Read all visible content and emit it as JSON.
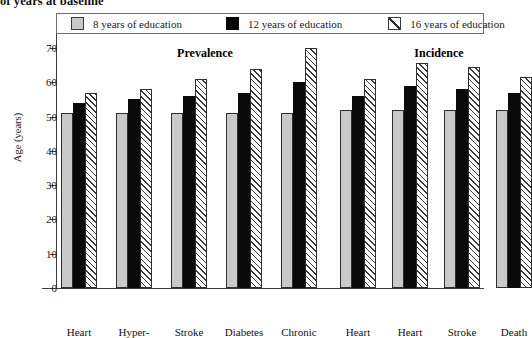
{
  "caption": "of years at baseline",
  "legend": {
    "items": [
      {
        "label": "8 years of education",
        "swatch": "gray-square-icon",
        "color": "#c9c9c9"
      },
      {
        "label": "12 years of education",
        "swatch": "black-square-icon",
        "color": "#0a0a0a"
      },
      {
        "label": "16 years of education",
        "swatch": "hatched-square-icon",
        "color": "#ffffff"
      }
    ]
  },
  "axis": {
    "ylabel": "Age (years)",
    "yticks": [
      "0",
      "10",
      "20",
      "30",
      "40",
      "50",
      "60",
      "70"
    ]
  },
  "sections": [
    {
      "title": "Prevalence"
    },
    {
      "title": "Incidence"
    }
  ],
  "chart_data": {
    "type": "bar",
    "title": "",
    "xlabel": "",
    "ylabel": "Age (years)",
    "ylim": [
      0,
      70
    ],
    "yticks": [
      0,
      10,
      20,
      30,
      40,
      50,
      60,
      70
    ],
    "grid": false,
    "legend_position": "top",
    "panels": [
      {
        "name": "Prevalence",
        "categories": [
          "Heart",
          "Hyper-",
          "Stroke",
          "Diabetes",
          "Chronic"
        ],
        "series": [
          {
            "name": "8 years of education",
            "values": [
              51,
              51,
              51,
              51,
              51
            ]
          },
          {
            "name": "12 years of education",
            "values": [
              54,
              55,
              56,
              57,
              60
            ]
          },
          {
            "name": "16 years of education",
            "values": [
              57,
              58,
              61,
              64,
              70
            ]
          }
        ]
      },
      {
        "name": "Incidence",
        "categories": [
          "Heart",
          "Heart",
          "Stroke",
          "Death"
        ],
        "series": [
          {
            "name": "8 years of education",
            "values": [
              52,
              52,
              52,
              52
            ]
          },
          {
            "name": "12 years of education",
            "values": [
              56,
              59,
              58,
              57
            ]
          },
          {
            "name": "16 years of education",
            "values": [
              61,
              65.5,
              64.5,
              61.5
            ]
          }
        ]
      }
    ]
  }
}
